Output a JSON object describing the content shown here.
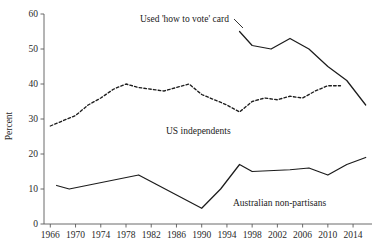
{
  "chart_data": {
    "type": "line",
    "title": "",
    "xlabel": "",
    "ylabel": "Percent",
    "xlim": [
      1965,
      2017
    ],
    "ylim": [
      0,
      60
    ],
    "grid": false,
    "legend": "inline-annotations",
    "xticks": [
      1966,
      1970,
      1974,
      1978,
      1982,
      1986,
      1990,
      1994,
      1998,
      2002,
      2006,
      2010,
      2014
    ],
    "yticks": [
      0,
      10,
      20,
      30,
      40,
      50,
      60
    ],
    "series": [
      {
        "name": "Used 'how to vote' card",
        "style": "solid",
        "color": "#1c1c1c",
        "x": [
          1996,
          1998,
          2001,
          2004,
          2007,
          2010,
          2013,
          2016
        ],
        "values": [
          55,
          51,
          50,
          53,
          50,
          45,
          41,
          34
        ]
      },
      {
        "name": "US independents",
        "style": "dashed",
        "color": "#1c1c1c",
        "x": [
          1966,
          1968,
          1970,
          1972,
          1974,
          1976,
          1978,
          1980,
          1982,
          1984,
          1986,
          1988,
          1990,
          1992,
          1994,
          1996,
          1998,
          2000,
          2002,
          2004,
          2006,
          2008,
          2010,
          2012
        ],
        "values": [
          28,
          29.5,
          31,
          34,
          36,
          38.5,
          40,
          39,
          38.5,
          38,
          39,
          40,
          37,
          35.5,
          34,
          32,
          35,
          36,
          35.5,
          36.5,
          36,
          38,
          39.5,
          39.5
        ]
      },
      {
        "name": "Australian non-partisans",
        "style": "solid",
        "color": "#1c1c1c",
        "x": [
          1967,
          1969,
          1980,
          1990,
          1993,
          1996,
          1998,
          2004,
          2007,
          2010,
          2013,
          2016
        ],
        "values": [
          11,
          10,
          14,
          4.5,
          10,
          17,
          15,
          15.5,
          16,
          14,
          17,
          19
        ]
      }
    ],
    "annotations": [
      {
        "name": "htv-card-label",
        "text": "Used 'how to vote' card",
        "x": 140,
        "y": 22,
        "anchor": "start",
        "leader": {
          "x1": 234,
          "y1": 19,
          "x2": 243,
          "y2": 28
        }
      },
      {
        "name": "us-independents-label",
        "text": "US independents",
        "x": 166,
        "y": 134,
        "anchor": "start",
        "leader": null
      },
      {
        "name": "australian-nonpartisans-label",
        "text": "Australian non-partisans",
        "x": 233,
        "y": 206,
        "anchor": "start",
        "leader": null
      }
    ]
  },
  "axis": {
    "y_title": "Percent",
    "y_tick_labels": [
      "0",
      "10",
      "20",
      "30",
      "40",
      "50",
      "60"
    ],
    "x_tick_labels": [
      "1966",
      "1970",
      "1974",
      "1978",
      "1982",
      "1986",
      "1990",
      "1994",
      "1998",
      "2002",
      "2006",
      "2010",
      "2014"
    ]
  },
  "colors": {
    "ink": "#1c1c1c",
    "axis": "#5a5a5a",
    "background": "#ffffff"
  }
}
